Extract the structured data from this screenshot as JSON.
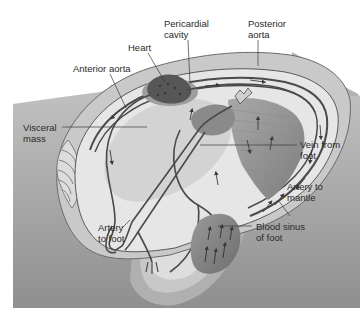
{
  "colors": {
    "background": "#ffffff",
    "sediment": "#a9a9a9",
    "sediment_dark": "#8c8c8c",
    "shell": "#cfcfcf",
    "mantle": "#e4e4e4",
    "visceral": "#d6d6d6",
    "foot_outer": "#bdbdbd",
    "foot_inner": "#dedede",
    "vessel": "#4a4a4a",
    "heart": "#5a5a5a",
    "label_text": "#2a2a2a"
  },
  "labels": [
    {
      "id": "heart",
      "text": "Heart"
    },
    {
      "id": "pericardial-cavity",
      "text": "Pericardial\ncavity"
    },
    {
      "id": "posterior-aorta",
      "text": "Posterior\naorta"
    },
    {
      "id": "anterior-aorta",
      "text": "Anterior aorta"
    },
    {
      "id": "visceral-mass",
      "text": "Visceral\nmass"
    },
    {
      "id": "vein-from-foot",
      "text": "Vein from\nfoot"
    },
    {
      "id": "artery-to-mantle",
      "text": "Artery to\nmantle"
    },
    {
      "id": "artery-to-foot",
      "text": "Artery\nto foot"
    },
    {
      "id": "blood-sinus-of-foot",
      "text": "Blood sinus\nof foot"
    }
  ]
}
